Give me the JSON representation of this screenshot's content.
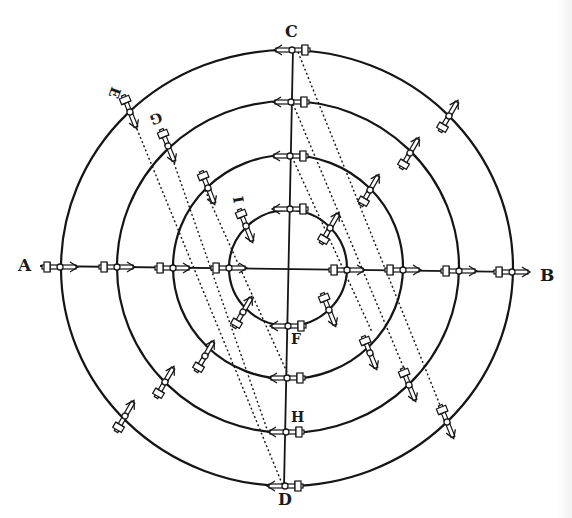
{
  "figure": {
    "kind": "concentric circles with rotating arrow-cross markers",
    "ink_color": "#151515",
    "paper_color": "#ffffff",
    "labels": {
      "A": "A",
      "B": "B",
      "C": "C",
      "D": "D",
      "E": "E",
      "F": "F",
      "G": "G",
      "H": "H",
      "I": "I"
    },
    "circle_count": 4,
    "axes": [
      "A-B horizontal",
      "C-D vertical"
    ],
    "dotted_parallel_lines": 4,
    "marker_icon": "arrow-with-cross-icon"
  }
}
